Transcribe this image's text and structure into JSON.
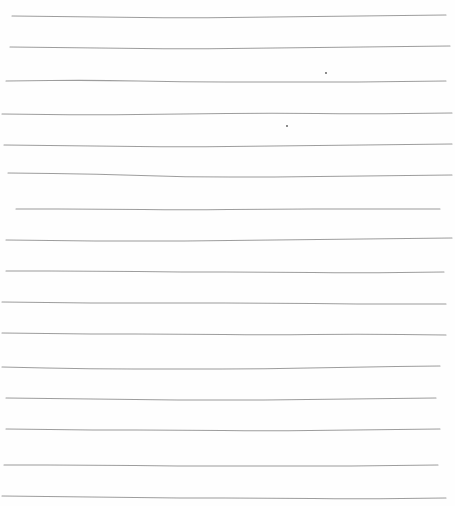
{
  "sheet": {
    "type": "lined-paper",
    "background": "#fefefe",
    "line_color": "#8c8c8c",
    "line_count": 16,
    "lines": [
      {
        "y": 16,
        "x1": 12,
        "x2": 446,
        "wave": [
          0,
          1,
          2,
          1,
          0,
          -1
        ]
      },
      {
        "y": 47,
        "x1": 10,
        "x2": 450,
        "wave": [
          0,
          1,
          2,
          1,
          0,
          -1
        ]
      },
      {
        "y": 81,
        "x1": 6,
        "x2": 446,
        "wave": [
          0,
          -1,
          1,
          1,
          1,
          0
        ]
      },
      {
        "y": 113,
        "x1": 2,
        "x2": 452,
        "wave": [
          1,
          2,
          1,
          0,
          1,
          0
        ]
      },
      {
        "y": 145,
        "x1": 4,
        "x2": 452,
        "wave": [
          0,
          1,
          2,
          1,
          0,
          -1
        ]
      },
      {
        "y": 175,
        "x1": 8,
        "x2": 452,
        "wave": [
          -2,
          -1,
          2,
          2,
          1,
          0
        ]
      },
      {
        "y": 209,
        "x1": 16,
        "x2": 440,
        "wave": [
          0,
          0,
          1,
          0,
          0,
          0
        ]
      },
      {
        "y": 240,
        "x1": 6,
        "x2": 452,
        "wave": [
          0,
          1,
          1,
          0,
          -1,
          -2
        ]
      },
      {
        "y": 271,
        "x1": 6,
        "x2": 444,
        "wave": [
          0,
          0,
          1,
          1,
          2,
          1
        ]
      },
      {
        "y": 302,
        "x1": 2,
        "x2": 446,
        "wave": [
          0,
          1,
          1,
          1,
          2,
          2
        ]
      },
      {
        "y": 333,
        "x1": 2,
        "x2": 446,
        "wave": [
          0,
          1,
          1,
          2,
          1,
          2
        ]
      },
      {
        "y": 367,
        "x1": 2,
        "x2": 440,
        "wave": [
          0,
          2,
          2,
          2,
          0,
          -1
        ]
      },
      {
        "y": 398,
        "x1": 6,
        "x2": 436,
        "wave": [
          0,
          1,
          2,
          2,
          1,
          0
        ]
      },
      {
        "y": 429,
        "x1": 6,
        "x2": 440,
        "wave": [
          0,
          1,
          1,
          2,
          1,
          0
        ]
      },
      {
        "y": 465,
        "x1": 4,
        "x2": 438,
        "wave": [
          0,
          0,
          1,
          1,
          1,
          0
        ]
      },
      {
        "y": 496,
        "x1": 2,
        "x2": 446,
        "wave": [
          0,
          1,
          2,
          2,
          3,
          2
        ]
      }
    ],
    "specks": [
      {
        "x": 326,
        "y": 73
      },
      {
        "x": 287,
        "y": 126
      }
    ]
  }
}
